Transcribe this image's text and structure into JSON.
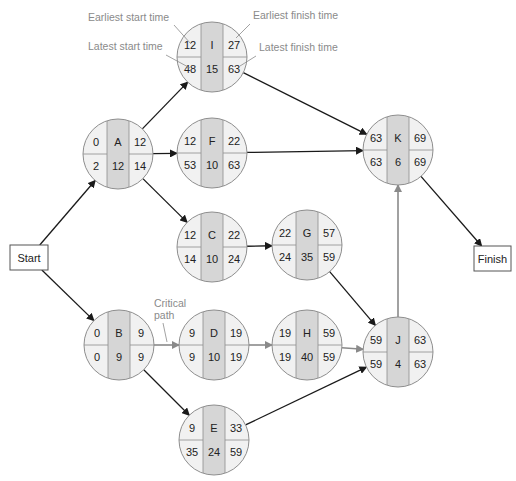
{
  "title_fragment": "",
  "colors": {
    "node_outer": "#f1f1f1",
    "node_center": "#d6d6d6",
    "node_stroke": "#8e8e8e",
    "arrow_normal": "#1a1a1a",
    "arrow_critical": "#8a8a8a",
    "annotation": "#8a8a8a"
  },
  "annotations": {
    "earliest_start": "Earliest start time",
    "earliest_finish": "Earliest finish time",
    "latest_start": "Latest start time",
    "latest_finish": "Latest finish time",
    "critical_line1": "Critical",
    "critical_line2": "path"
  },
  "terminals": {
    "start": "Start",
    "finish": "Finish"
  },
  "nodes": [
    {
      "id": "I",
      "es": "12",
      "ef": "27",
      "ls": "48",
      "dur": "15",
      "lf": "63",
      "cx": 212,
      "cy": 57
    },
    {
      "id": "A",
      "es": "0",
      "ef": "12",
      "ls": "2",
      "dur": "12",
      "lf": "14",
      "cx": 118,
      "cy": 154
    },
    {
      "id": "F",
      "es": "12",
      "ef": "22",
      "ls": "53",
      "dur": "10",
      "lf": "63",
      "cx": 212,
      "cy": 153
    },
    {
      "id": "K",
      "es": "63",
      "ef": "69",
      "ls": "63",
      "dur": "6",
      "lf": "69",
      "cx": 398,
      "cy": 150
    },
    {
      "id": "C",
      "es": "12",
      "ef": "22",
      "ls": "14",
      "dur": "10",
      "lf": "24",
      "cx": 212,
      "cy": 247
    },
    {
      "id": "G",
      "es": "22",
      "ef": "57",
      "ls": "24",
      "dur": "35",
      "lf": "59",
      "cx": 307,
      "cy": 245
    },
    {
      "id": "B",
      "es": "0",
      "ef": "9",
      "ls": "0",
      "dur": "9",
      "lf": "9",
      "cx": 119,
      "cy": 345
    },
    {
      "id": "D",
      "es": "9",
      "ef": "19",
      "ls": "9",
      "dur": "10",
      "lf": "19",
      "cx": 214,
      "cy": 345
    },
    {
      "id": "H",
      "es": "19",
      "ef": "59",
      "ls": "19",
      "dur": "40",
      "lf": "59",
      "cx": 307,
      "cy": 345
    },
    {
      "id": "J",
      "es": "59",
      "ef": "63",
      "ls": "59",
      "dur": "4",
      "lf": "63",
      "cx": 398,
      "cy": 352
    },
    {
      "id": "E",
      "es": "9",
      "ef": "33",
      "ls": "35",
      "dur": "24",
      "lf": "59",
      "cx": 214,
      "cy": 440
    }
  ],
  "edges": [
    {
      "from": "Start",
      "to": "A",
      "critical": false
    },
    {
      "from": "Start",
      "to": "B",
      "critical": false
    },
    {
      "from": "A",
      "to": "I",
      "critical": false
    },
    {
      "from": "A",
      "to": "F",
      "critical": false
    },
    {
      "from": "A",
      "to": "C",
      "critical": false
    },
    {
      "from": "I",
      "to": "K",
      "critical": false
    },
    {
      "from": "F",
      "to": "K",
      "critical": false
    },
    {
      "from": "C",
      "to": "G",
      "critical": false
    },
    {
      "from": "G",
      "to": "J",
      "critical": false
    },
    {
      "from": "B",
      "to": "D",
      "critical": true
    },
    {
      "from": "B",
      "to": "E",
      "critical": false
    },
    {
      "from": "D",
      "to": "H",
      "critical": true
    },
    {
      "from": "H",
      "to": "J",
      "critical": true
    },
    {
      "from": "E",
      "to": "J",
      "critical": false
    },
    {
      "from": "J",
      "to": "K",
      "critical": true
    },
    {
      "from": "K",
      "to": "Finish",
      "critical": false
    }
  ]
}
